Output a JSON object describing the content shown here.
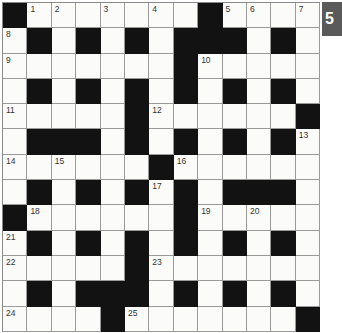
{
  "puzzle": {
    "type": "crossword",
    "columns": 13,
    "rows_visible": 13,
    "colors": {
      "black_cell": "#121212",
      "white_cell": "#fbfbf9",
      "grid_line": "#9a9a9a",
      "number_text": "#333333"
    },
    "legend": "Each row string: '#' = black square, '.' = empty white square; numbers listed in 'numbers' by [row, col].",
    "grid": [
      "#.......#....",
      ".#.#.#.###.#.",
      ".......#.....",
      ".#.#.#.#.#.#.",
      ".....#......#",
      ".###.#.#.#.#.",
      "......#......",
      ".#.#.#.#.###.",
      "#......#.....",
      ".#.#.#.#.#.#.",
      ".....#.......",
      ".#.###.#.#.#.",
      "....#.......#"
    ],
    "numbers": [
      {
        "row": 0,
        "col": 1,
        "label": "1"
      },
      {
        "row": 0,
        "col": 2,
        "label": "2"
      },
      {
        "row": 0,
        "col": 4,
        "label": "3"
      },
      {
        "row": 0,
        "col": 6,
        "label": "4"
      },
      {
        "row": 0,
        "col": 9,
        "label": "5"
      },
      {
        "row": 0,
        "col": 10,
        "label": "6"
      },
      {
        "row": 0,
        "col": 12,
        "label": "7"
      },
      {
        "row": 1,
        "col": 0,
        "label": "8"
      },
      {
        "row": 2,
        "col": 0,
        "label": "9"
      },
      {
        "row": 2,
        "col": 8,
        "label": "10"
      },
      {
        "row": 4,
        "col": 0,
        "label": "11"
      },
      {
        "row": 4,
        "col": 6,
        "label": "12"
      },
      {
        "row": 5,
        "col": 12,
        "label": "13"
      },
      {
        "row": 6,
        "col": 0,
        "label": "14"
      },
      {
        "row": 6,
        "col": 2,
        "label": "15"
      },
      {
        "row": 6,
        "col": 7,
        "label": "16"
      },
      {
        "row": 7,
        "col": 6,
        "label": "17"
      },
      {
        "row": 8,
        "col": 1,
        "label": "18"
      },
      {
        "row": 8,
        "col": 8,
        "label": "19"
      },
      {
        "row": 8,
        "col": 10,
        "label": "20"
      },
      {
        "row": 9,
        "col": 0,
        "label": "21"
      },
      {
        "row": 10,
        "col": 0,
        "label": "22"
      },
      {
        "row": 10,
        "col": 6,
        "label": "23"
      },
      {
        "row": 12,
        "col": 0,
        "label": "24"
      },
      {
        "row": 12,
        "col": 5,
        "label": "25"
      }
    ]
  },
  "page_badge": {
    "label": "5",
    "color": "#5a5a5a"
  }
}
